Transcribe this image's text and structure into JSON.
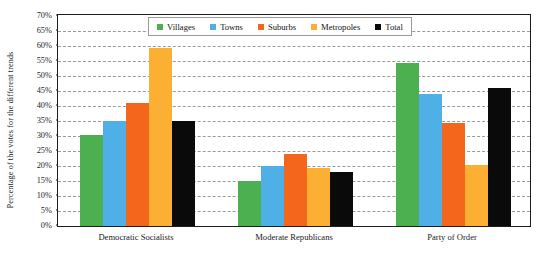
{
  "chart_data": {
    "type": "bar",
    "title": "",
    "subtitle": "",
    "xlabel": "",
    "ylabel": "Percentage of the votes for the different trends",
    "categories": [
      "Democratic Socialists",
      "Moderate Republicans",
      "Party of Order"
    ],
    "series": [
      {
        "name": "Villages",
        "color": "#4CAF50",
        "values": [
          30.5,
          15.0,
          54.5
        ]
      },
      {
        "name": "Towns",
        "color": "#4FB0E8",
        "values": [
          35.0,
          20.0,
          44.0
        ]
      },
      {
        "name": "Suburbs",
        "color": "#F4661B",
        "values": [
          41.0,
          24.0,
          34.5
        ]
      },
      {
        "name": "Metropoles",
        "color": "#FBB034",
        "values": [
          59.5,
          19.5,
          20.5
        ]
      },
      {
        "name": "Total",
        "color": "#0A0A0A",
        "values": [
          35.0,
          18.0,
          46.0
        ]
      }
    ],
    "ylim": [
      0,
      70
    ],
    "ytick_step": 5,
    "ytick_labels": [
      "0%",
      "5%",
      "10%",
      "15%",
      "20%",
      "25%",
      "30%",
      "35%",
      "40%",
      "45%",
      "50%",
      "55%",
      "60%",
      "65%",
      "70%"
    ],
    "grid": true,
    "grid_style": "dashed",
    "grid_axis": "y",
    "legend_position": "top-center",
    "legend_entries": [
      "Villages",
      "Towns",
      "Suburbs",
      "Metropoles",
      "Total"
    ]
  }
}
